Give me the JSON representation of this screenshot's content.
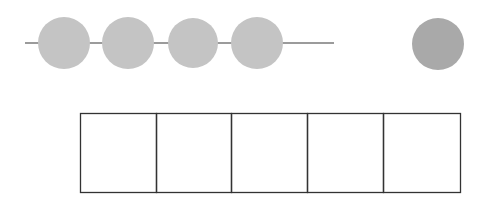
{
  "diagram": {
    "colors": {
      "background": "#ffffff",
      "line": "#7a7a7a",
      "circle_light": "#c4c4c4",
      "circle_dark": "#a9a9a9",
      "box_stroke": "#333333"
    },
    "line": {
      "x1": 25,
      "y1": 43,
      "x2": 334,
      "y2": 43
    },
    "circles_on_line": [
      {
        "cx": 64,
        "cy": 43,
        "r": 26
      },
      {
        "cx": 128,
        "cy": 43,
        "r": 26
      },
      {
        "cx": 193,
        "cy": 43,
        "r": 25
      },
      {
        "cx": 257,
        "cy": 43,
        "r": 26
      }
    ],
    "separate_circle": {
      "cx": 438,
      "cy": 44,
      "r": 26
    },
    "boxes": {
      "x": 80,
      "y": 113,
      "height": 79,
      "count": 5,
      "dividers": [
        80,
        156,
        231,
        307,
        383,
        460
      ]
    }
  }
}
